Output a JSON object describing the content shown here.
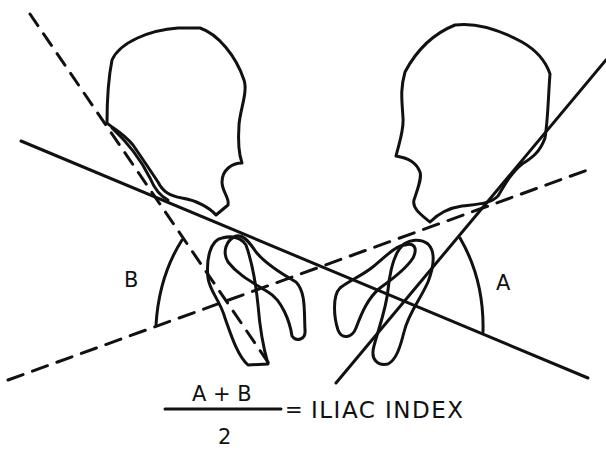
{
  "figure": {
    "labels": {
      "angle_a": "A",
      "angle_b": "B"
    },
    "formula": {
      "numerator": "A + B",
      "denominator": "2",
      "equals": "=",
      "result": "ILIAC INDEX"
    }
  },
  "colors": {
    "background": "#ffffff",
    "ink": "#111111"
  }
}
